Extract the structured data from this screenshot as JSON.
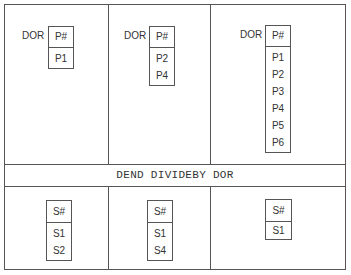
{
  "divisors": [
    {
      "label": "DOR",
      "header": "P#",
      "rows": [
        "P1"
      ]
    },
    {
      "label": "DOR",
      "header": "P#",
      "rows": [
        "P2",
        "P4"
      ]
    },
    {
      "label": "DOR",
      "header": "P#",
      "rows": [
        "P1",
        "P2",
        "P3",
        "P4",
        "P5",
        "P6"
      ]
    }
  ],
  "operation": "DEND DIVIDEBY DOR",
  "results": [
    {
      "header": "S#",
      "rows": [
        "S1",
        "S2"
      ]
    },
    {
      "header": "S#",
      "rows": [
        "S1",
        "S4"
      ]
    },
    {
      "header": "S#",
      "rows": [
        "S1"
      ]
    }
  ]
}
